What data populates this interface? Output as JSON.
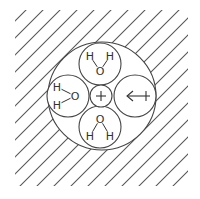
{
  "diagram": {
    "background": "#ffffff",
    "line_color": "#444444",
    "solvent_region": {
      "pattern": "diagonal-hatch",
      "x": 15,
      "y": 10,
      "width": 173,
      "height": 176,
      "spacing": 17
    },
    "hydration_shell": {
      "cx": 102,
      "cy": 96,
      "r": 54
    },
    "ion": {
      "label": "+",
      "charge": "positive",
      "cx": 101,
      "cy": 96,
      "r": 11
    },
    "molecules": [
      {
        "position": "top",
        "cx": 100,
        "cy": 64,
        "r": 21,
        "atoms": [
          {
            "label": "H",
            "x": 90,
            "y": 56
          },
          {
            "label": "H",
            "x": 110,
            "y": 56
          },
          {
            "label": "O",
            "x": 100,
            "y": 71
          }
        ]
      },
      {
        "position": "left",
        "cx": 68,
        "cy": 96,
        "r": 21,
        "atoms": [
          {
            "label": "H",
            "x": 57,
            "y": 87
          },
          {
            "label": "H",
            "x": 57,
            "y": 105
          },
          {
            "label": "O",
            "x": 75,
            "y": 96
          }
        ]
      },
      {
        "position": "bottom",
        "cx": 100,
        "cy": 127,
        "r": 21,
        "atoms": [
          {
            "label": "O",
            "x": 100,
            "y": 119
          },
          {
            "label": "H",
            "x": 90,
            "y": 136
          },
          {
            "label": "H",
            "x": 110,
            "y": 136
          }
        ]
      },
      {
        "position": "right",
        "cx": 135,
        "cy": 96,
        "r": 21,
        "symbol": "dipole-arrow",
        "dipole": {
          "x1": 150,
          "x2": 127,
          "y": 96
        }
      }
    ]
  }
}
